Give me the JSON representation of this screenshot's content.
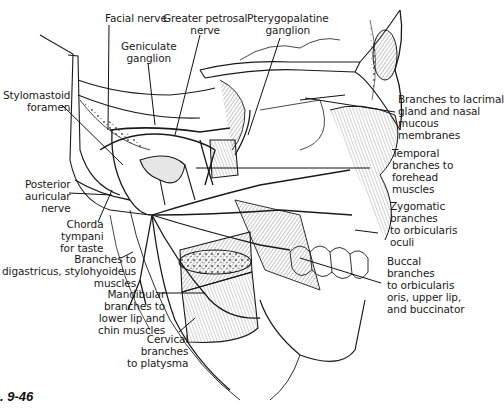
{
  "figure": {
    "caption": "g. 9-46"
  },
  "labels": {
    "facial_nerve": "Facial nerve",
    "greater_petrosal": "Greater petrosal\nnerve",
    "pterygopalatine": "Pterygopalatine\nganglion",
    "geniculate": "Geniculate\nganglion",
    "stylomastoid": "Stylomastoid\nforamen",
    "lacrimal": "Branches to lacrimal\ngland and nasal\nmucous\nmembranes",
    "temporal": "Temporal\nbranches to\nforehead\nmuscles",
    "posterior_auricular": "Posterior\nauricular\nnerve",
    "zygomatic": "Zygomatic\nbranches\nto orbicularis\noculi",
    "chorda_tympani": "Chorda\ntympani\nfor taste",
    "digastricus": "Branches to\ndigastricus, stylohyoideus\nmuscles",
    "buccal": "Buccal\nbranches\nto orbicularis\noris, upper lip,\nand buccinator",
    "mandibular": "Mandibular\nbranches to\nlower lip and\nchin muscles",
    "cervical": "Cervical\nbranches\nto platysma"
  },
  "colors": {
    "ink": "#1a1a1a",
    "paper": "#ffffff",
    "shade": "#bdbdbd"
  }
}
